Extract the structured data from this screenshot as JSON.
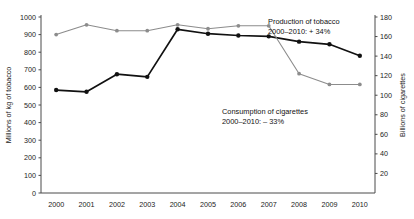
{
  "chart_data": {
    "type": "line",
    "title": "",
    "xlabel": "",
    "categories": [
      "2000",
      "2001",
      "2002",
      "2003",
      "2004",
      "2005",
      "2006",
      "2007",
      "2008",
      "2009",
      "2010"
    ],
    "x": [
      2000,
      2001,
      2002,
      2003,
      2004,
      2005,
      2006,
      2007,
      2008,
      2009,
      2010
    ],
    "grid": false,
    "legend_position": "inline-annotation",
    "axes": {
      "left": {
        "label": "Millions of kg of tobacco",
        "ticks": [
          0,
          100,
          200,
          300,
          400,
          500,
          600,
          700,
          800,
          900,
          1000
        ],
        "lim": [
          0,
          1000
        ]
      },
      "right": {
        "label": "Billions of cigarettes",
        "ticks": [
          20,
          40,
          60,
          80,
          100,
          120,
          140,
          160,
          180
        ],
        "lim": [
          0,
          180
        ]
      }
    },
    "series": [
      {
        "name": "Production of tobacco",
        "axis": "left",
        "unit": "Millions of kg of tobacco",
        "color": "#111111",
        "values": [
          585,
          575,
          675,
          660,
          930,
          905,
          895,
          890,
          860,
          845,
          780
        ]
      },
      {
        "name": "Consumption of cigarettes",
        "axis": "right",
        "unit": "Billions of cigarettes",
        "color": "#8c8c8c",
        "values": [
          162,
          172,
          166,
          166,
          172,
          168,
          171,
          171,
          122,
          111,
          111
        ]
      }
    ],
    "annotations": [
      {
        "name": "production-annotation",
        "line1": "Production of tobacco",
        "line2": "2000–2010: + 34%"
      },
      {
        "name": "consumption-annotation",
        "line1": "Consumption of cigarettes",
        "line2": "2000–2010: – 33%"
      }
    ]
  }
}
